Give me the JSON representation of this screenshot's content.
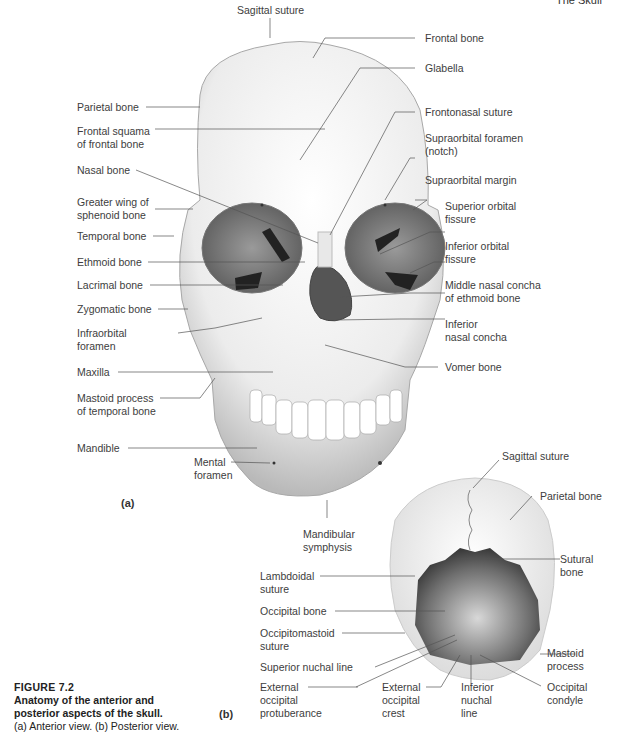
{
  "running_head": "The Skull",
  "figure": {
    "number": "FIGURE 7.2",
    "title_line1": "Anatomy of the anterior and",
    "title_line2": "posterior aspects of the skull.",
    "desc": "(a) Anterior view. (b) Posterior view."
  },
  "panels": {
    "a": "(a)",
    "b": "(b)"
  },
  "anterior_labels": {
    "sagittal_suture": "Sagittal suture",
    "frontal_bone": "Frontal bone",
    "glabella": "Glabella",
    "parietal_bone": "Parietal bone",
    "frontal_squama_1": "Frontal squama",
    "frontal_squama_2": "of frontal bone",
    "frontonasal_suture": "Frontonasal suture",
    "nasal_bone": "Nasal bone",
    "supraorbital_foramen_1": "Supraorbital foramen",
    "supraorbital_foramen_2": "(notch)",
    "greater_wing_1": "Greater wing of",
    "greater_wing_2": "sphenoid bone",
    "supraorbital_margin": "Supraorbital margin",
    "temporal_bone": "Temporal bone",
    "superior_orbital_1": "Superior orbital",
    "superior_orbital_2": "fissure",
    "ethmoid_bone": "Ethmoid bone",
    "inferior_orbital_1": "Inferior orbital",
    "inferior_orbital_2": "fissure",
    "lacrimal_bone": "Lacrimal bone",
    "middle_concha_1": "Middle nasal concha",
    "middle_concha_2": "of ethmoid bone",
    "zygomatic_bone": "Zygomatic bone",
    "infraorbital_1": "Infraorbital",
    "infraorbital_2": "foramen",
    "inferior_concha_1": "Inferior",
    "inferior_concha_2": "nasal concha",
    "maxilla": "Maxilla",
    "vomer_bone": "Vomer bone",
    "mastoid_1": "Mastoid process",
    "mastoid_2": "of temporal bone",
    "mandible": "Mandible",
    "mental_1": "Mental",
    "mental_2": "foramen",
    "symphysis_1": "Mandibular",
    "symphysis_2": "symphysis"
  },
  "posterior_labels": {
    "sagittal_suture": "Sagittal suture",
    "parietal_bone": "Parietal bone",
    "sutural_1": "Sutural",
    "sutural_2": "bone",
    "lambdoidal_1": "Lambdoidal",
    "lambdoidal_2": "suture",
    "occipital_bone": "Occipital bone",
    "occipitomastoid_1": "Occipitomastoid",
    "occipitomastoid_2": "suture",
    "superior_nuchal": "Superior nuchal line",
    "mastoid_1": "Mastoid",
    "mastoid_2": "process",
    "ext_protuberance_1": "External",
    "ext_protuberance_2": "occipital",
    "ext_protuberance_3": "protuberance",
    "ext_crest_1": "External",
    "ext_crest_2": "occipital",
    "ext_crest_3": "crest",
    "inferior_nuchal_1": "Inferior",
    "inferior_nuchal_2": "nuchal",
    "inferior_nuchal_3": "line",
    "occipital_condyle_1": "Occipital",
    "occipital_condyle_2": "condyle"
  }
}
